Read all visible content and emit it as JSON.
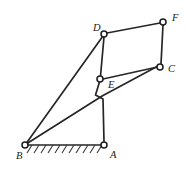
{
  "figure": {
    "type": "kinematic-linkage",
    "canvas": {
      "width": 187,
      "height": 176,
      "background": "#ffffff"
    },
    "stroke_color": "#262626",
    "joint_fill": "#ffffff",
    "label_color": "#1a1a1a"
  },
  "joints": [
    {
      "id": "A",
      "label": "A",
      "x": 104,
      "y": 145,
      "radius": 3.0,
      "label_x": 110,
      "label_y": 156,
      "grounded": true
    },
    {
      "id": "B",
      "label": "B",
      "x": 25,
      "y": 145,
      "radius": 3.0,
      "label_x": 16,
      "label_y": 157,
      "grounded": true
    },
    {
      "id": "C",
      "label": "C",
      "x": 160,
      "y": 67,
      "radius": 3.0,
      "label_x": 168,
      "label_y": 70,
      "grounded": false
    },
    {
      "id": "D",
      "label": "D",
      "x": 104,
      "y": 34,
      "radius": 3.0,
      "label_x": 93,
      "label_y": 29,
      "grounded": false
    },
    {
      "id": "E",
      "label": "E",
      "x": 100,
      "y": 79,
      "radius": 3.0,
      "label_x": 108,
      "label_y": 86,
      "grounded": false
    },
    {
      "id": "F",
      "label": "F",
      "x": 163,
      "y": 22,
      "radius": 3.0,
      "label_x": 172,
      "label_y": 19,
      "grounded": false
    }
  ],
  "links": [
    {
      "id": "BD",
      "from": "B",
      "to": "D",
      "path": "M 26.5 143 L 103 36"
    },
    {
      "id": "BC",
      "from": "B",
      "to": "C",
      "path": "M 27 143.5 L 95 100.5 L 103 95.5 L 158 66"
    },
    {
      "id": "DE",
      "from": "D",
      "to": "E",
      "path": "M 104 37 L 100.5 76"
    },
    {
      "id": "DF",
      "from": "D",
      "to": "F",
      "path": "M 107 33 L 160 23"
    },
    {
      "id": "FC",
      "from": "F",
      "to": "C",
      "path": "M 163 25 L 161 64"
    },
    {
      "id": "EC",
      "from": "E",
      "to": "C",
      "path": "M 103 79 L 157.5 67"
    },
    {
      "id": "AE",
      "from": "A",
      "to": "E",
      "path": "M 104 142 L 103 99 L 95.5 95 L 99.5 82"
    }
  ],
  "ground": {
    "id": "ground-BA",
    "label": "fixed ground between B and A",
    "path": "M 25 145 L 104 145",
    "hatch_count": 11,
    "hatch_start_x": 27,
    "hatch_spacing": 7,
    "hatch_dx": 5,
    "hatch_dy": 8
  }
}
